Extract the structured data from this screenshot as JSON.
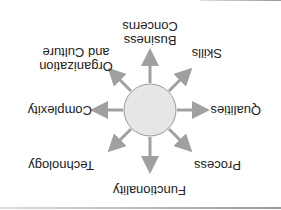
{
  "diagram": {
    "orientation": "rotated-180",
    "center": {
      "label": "",
      "fill": "#e6e6e6",
      "stroke": "#9a9a9a"
    },
    "arrow_color": "#a0a0a0",
    "nodes": [
      {
        "id": "business-concerns",
        "line1": "Business",
        "line2": "Concerns"
      },
      {
        "id": "skills",
        "label": "Skills"
      },
      {
        "id": "qualities",
        "label": "Qualities"
      },
      {
        "id": "process",
        "label": "Process"
      },
      {
        "id": "functionality",
        "label": "Functionality"
      },
      {
        "id": "technology",
        "label": "Technology"
      },
      {
        "id": "complexity",
        "label": "Complexity"
      },
      {
        "id": "organization-culture",
        "line1": "Organization",
        "line2": "and Culture"
      }
    ]
  }
}
